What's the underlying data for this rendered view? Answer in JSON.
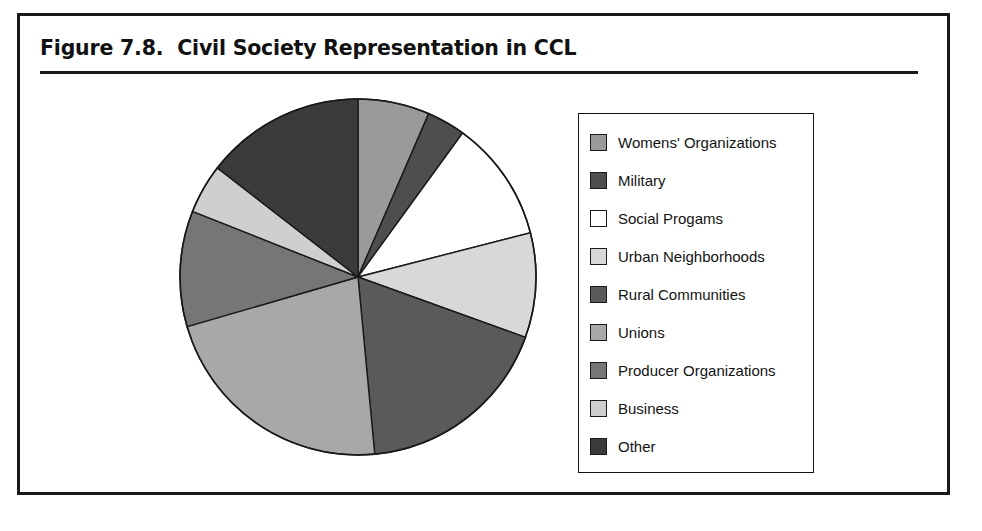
{
  "figure": {
    "title": "Figure 7.8.  Civil Society Representation in CCL"
  },
  "legend": {
    "position": "right",
    "items": [
      {
        "label": "Womens' Organizations",
        "color": "#9a9a9a"
      },
      {
        "label": "Military",
        "color": "#4e4e4e"
      },
      {
        "label": "Social Progams",
        "color": "#ffffff"
      },
      {
        "label": "Urban Neighborhoods",
        "color": "#d8d8d8"
      },
      {
        "label": "Rural Communities",
        "color": "#5a5a5a"
      },
      {
        "label": "Unions",
        "color": "#a8a8a8"
      },
      {
        "label": "Producer Organizations",
        "color": "#767676"
      },
      {
        "label": "Business",
        "color": "#cfcfcf"
      },
      {
        "label": "Other",
        "color": "#3b3b3b"
      }
    ]
  },
  "chart_data": {
    "type": "pie",
    "title": "Figure 7.8.  Civil Society Representation in CCL",
    "xlabel": "",
    "ylabel": "",
    "start_angle_deg": 0,
    "direction": "clockwise",
    "legend_position": "right",
    "grid": false,
    "categories": [
      "Womens' Organizations",
      "Military",
      "Social Progams",
      "Urban Neighborhoods",
      "Rural Communities",
      "Unions",
      "Producer Organizations",
      "Business",
      "Other"
    ],
    "values": [
      6.5,
      3.5,
      11.0,
      9.5,
      18.0,
      22.0,
      10.5,
      4.5,
      14.5
    ],
    "unit": "percent",
    "colors": [
      "#9a9a9a",
      "#4e4e4e",
      "#ffffff",
      "#d8d8d8",
      "#5a5a5a",
      "#a8a8a8",
      "#767676",
      "#cfcfcf",
      "#3b3b3b"
    ]
  },
  "caption": {
    "cutoff_text": ""
  }
}
